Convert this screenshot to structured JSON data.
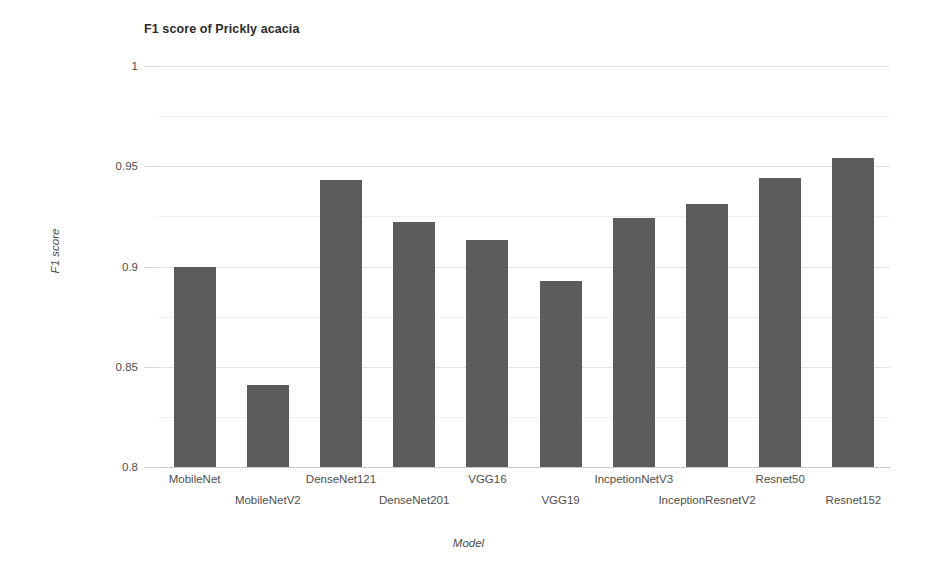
{
  "chart_data": {
    "type": "bar",
    "title": "F1 score of Prickly acacia",
    "xlabel": "Model",
    "ylabel": "F1 score",
    "categories": [
      "MobileNet",
      "MobileNetV2",
      "DenseNet121",
      "DenseNet201",
      "VGG16",
      "VGG19",
      "IncpetionNetV3",
      "InceptionResnetV2",
      "Resnet50",
      "Resnet152"
    ],
    "values": [
      0.9,
      0.841,
      0.943,
      0.922,
      0.913,
      0.893,
      0.924,
      0.931,
      0.944,
      0.954
    ],
    "ylim": [
      0.8,
      1.0
    ],
    "yticks": [
      0.8,
      0.85,
      0.9,
      0.95,
      1
    ],
    "ytick_labels": [
      "0.8",
      "0.85",
      "0.9",
      "0.95",
      "1"
    ],
    "minor_yticks": [
      0.825,
      0.875,
      0.925,
      0.975
    ],
    "grid": true,
    "legend": null,
    "bar_color": "#5c5c5c",
    "grid_color": "#e3e3e3",
    "background_color": "#ffffff"
  }
}
